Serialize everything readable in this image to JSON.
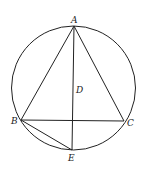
{
  "diagram": {
    "stroke_color": "#222222",
    "circle": {
      "cx": 73.5,
      "cy": 88,
      "r": 62
    },
    "points": {
      "A": {
        "x": 74,
        "y": 26,
        "label": "A",
        "lx": 71,
        "ly": 23
      },
      "B": {
        "x": 21,
        "y": 120,
        "label": "B",
        "lx": 11,
        "ly": 124
      },
      "C": {
        "x": 124,
        "y": 121,
        "label": "C",
        "lx": 127,
        "ly": 126
      },
      "D": {
        "x": 73,
        "y": 90,
        "label": "D",
        "lx": 76,
        "ly": 93
      },
      "E": {
        "x": 72,
        "y": 150,
        "label": "E",
        "lx": 68,
        "ly": 161
      }
    },
    "segments": [
      [
        "A",
        "B"
      ],
      [
        "A",
        "C"
      ],
      [
        "B",
        "C"
      ],
      [
        "A",
        "E"
      ],
      [
        "B",
        "E"
      ]
    ]
  }
}
